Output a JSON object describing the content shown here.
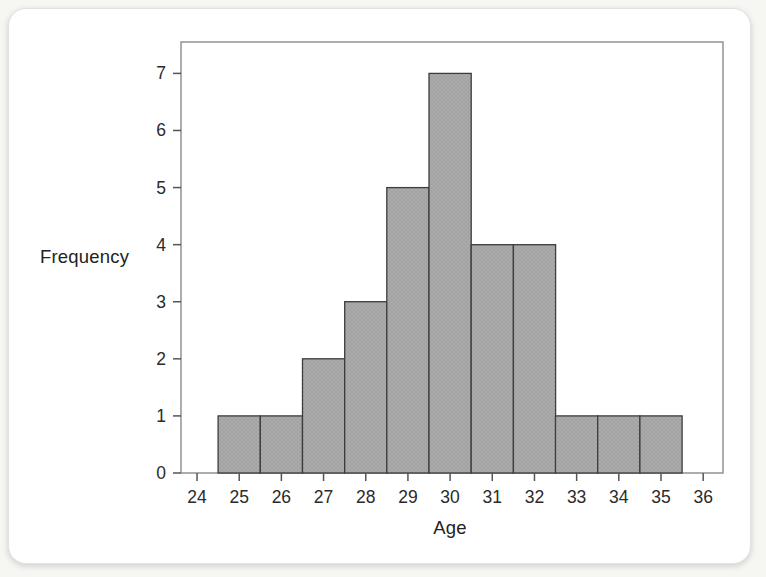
{
  "page": {
    "background_color": "#f6f6f3",
    "card_color": "#ffffff"
  },
  "chart_data": {
    "type": "bar",
    "subtype": "histogram",
    "title": "",
    "xlabel": "Age",
    "ylabel": "Frequency",
    "categories": [
      25,
      26,
      27,
      28,
      29,
      30,
      31,
      32,
      33,
      34,
      35
    ],
    "values": [
      1,
      1,
      2,
      3,
      5,
      7,
      4,
      4,
      1,
      1,
      1
    ],
    "bar_width": 1,
    "x_ticks": [
      24,
      25,
      26,
      27,
      28,
      29,
      30,
      31,
      32,
      33,
      34,
      35,
      36
    ],
    "y_ticks": [
      0,
      1,
      2,
      3,
      4,
      5,
      6,
      7
    ],
    "xlim": [
      23.62,
      36.47
    ],
    "ylim": [
      0,
      7.55
    ],
    "grid": false,
    "legend": "none",
    "colors": {
      "bar_fill": "#acacac",
      "bar_hatch": "#9b9b9b",
      "bar_stroke": "#3c3c3c",
      "axis": "#8b8b8b",
      "tick": "#555555",
      "text": "#2b2b2b"
    }
  }
}
